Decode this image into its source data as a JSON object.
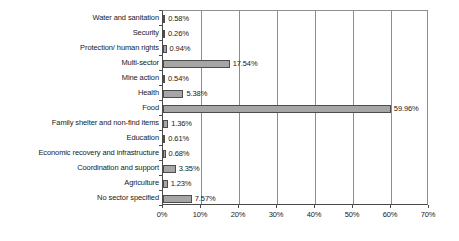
{
  "chart_data": {
    "type": "bar",
    "orientation": "horizontal",
    "title": "",
    "subtitle": "",
    "xlabel": "",
    "ylabel": "",
    "xlim": [
      0,
      70
    ],
    "xticks": [
      0,
      10,
      20,
      30,
      40,
      50,
      60,
      70
    ],
    "xtick_labels": [
      "0%",
      "10%",
      "20%",
      "30%",
      "40%",
      "50%",
      "60%",
      "70%"
    ],
    "grid": true,
    "grid_axis": "x",
    "legend": false,
    "legend_position": "none",
    "value_labels": true,
    "bar_color": "#a6a6a6",
    "bar_border_color": "#4d4d4d",
    "axis_color": "#4a4a4a",
    "gridline_color": "#8d8d8d",
    "background": "#ffffff",
    "categories": [
      "Water and sanitation",
      "Security",
      "Protection/ human rights",
      "Multi-sector",
      "Mine action",
      "Health",
      "Food",
      "Family shelter and non-find items",
      "Education",
      "Economic recovery and infrastructure",
      "Coordination and support",
      "Agriculture",
      "No sector specified"
    ],
    "values": [
      0.58,
      0.26,
      0.94,
      17.54,
      0.54,
      5.38,
      59.96,
      1.36,
      0.61,
      0.68,
      3.35,
      1.23,
      7.57
    ],
    "value_label_text": [
      "0.58%",
      "0.26%",
      "0.94%",
      "17.54%",
      "0.54%",
      "5.38%",
      "59.96%",
      "1.36%",
      "0.61%",
      "0.68%",
      "3.35%",
      "1.23%",
      "7.57%"
    ]
  }
}
